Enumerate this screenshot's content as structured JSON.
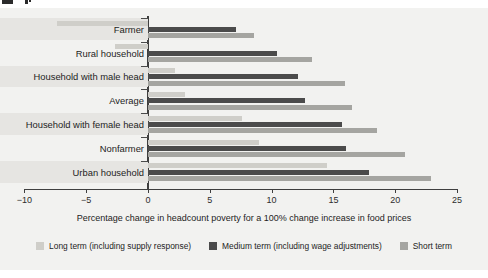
{
  "chart_data": {
    "type": "bar",
    "orientation": "horizontal",
    "title": "",
    "xlabel": "Percentage change in headcount poverty for a 100% change increase in food prices",
    "ylabel": "",
    "xlim": [
      -10,
      25
    ],
    "xticks": [
      -10,
      -5,
      0,
      5,
      10,
      15,
      20,
      25
    ],
    "xticklabels": [
      "−10",
      "−5",
      "0",
      "5",
      "10",
      "15",
      "20",
      "25"
    ],
    "grid": false,
    "legend_position": "bottom",
    "categories": [
      "Farmer",
      "Rural household",
      "Household with male head",
      "Average",
      "Household with female head",
      "Nonfarmer",
      "Urban household"
    ],
    "series": [
      {
        "name": "Long term (including supply response)",
        "color": "#cfcec9",
        "values": [
          -7.4,
          -2.7,
          2.2,
          3.0,
          7.6,
          9.0,
          14.5
        ]
      },
      {
        "name": "Medium term (including wage adjustments)",
        "color": "#4b4b4b",
        "values": [
          7.1,
          10.4,
          12.1,
          12.7,
          15.7,
          16.0,
          17.9
        ]
      },
      {
        "name": "Short term",
        "color": "#a5a5a1",
        "values": [
          8.6,
          13.3,
          15.9,
          16.5,
          18.5,
          20.8,
          22.9
        ]
      }
    ]
  },
  "axis": {
    "title": "Percentage change in headcount poverty for a 100% change increase in food prices"
  },
  "legend": {
    "items": [
      {
        "label": "Long term (including supply response)",
        "color": "#cfcec9",
        "swatch": "legend-swatch-long-term"
      },
      {
        "label": "Medium term (including wage adjustments)",
        "color": "#4b4b4b",
        "swatch": "legend-swatch-medium-term"
      },
      {
        "label": "Short term",
        "color": "#a5a5a1",
        "swatch": "legend-swatch-short-term"
      }
    ]
  }
}
